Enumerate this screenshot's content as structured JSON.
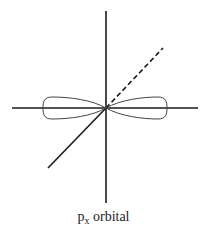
{
  "diagram": {
    "colors": {
      "axis": "#1a1a1a",
      "lobe": "#444444",
      "background": "#ffffff"
    },
    "center": {
      "x": 106,
      "y": 108
    },
    "axes": {
      "x_axis": {
        "x1": 12,
        "y1": 108,
        "x2": 198,
        "y2": 108,
        "style": "solid"
      },
      "y_axis": {
        "x1": 106,
        "y1": 11,
        "x2": 106,
        "y2": 203,
        "style": "solid"
      },
      "z_axis_front": {
        "x1": 106,
        "y1": 108,
        "x2": 48,
        "y2": 168,
        "style": "solid"
      },
      "z_axis_back": {
        "x1": 106,
        "y1": 108,
        "x2": 163,
        "y2": 48,
        "style": "dashed"
      }
    },
    "lobes": [
      {
        "side": "left",
        "tip_x": 43,
        "half_height": 11
      },
      {
        "side": "right",
        "tip_x": 167,
        "half_height": 11
      }
    ]
  },
  "caption": {
    "base": "p",
    "subscript": "x",
    "rest": " orbital"
  }
}
